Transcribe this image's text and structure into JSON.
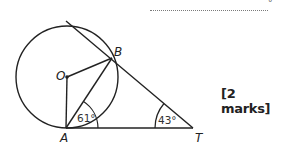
{
  "answer": {
    "line_style": "dotted",
    "unit_symbol": "°"
  },
  "marks_label": "[2 marks]",
  "diagram": {
    "points": {
      "O": {
        "label": "O",
        "x": 67,
        "y": 77
      },
      "A": {
        "label": "A",
        "x": 66,
        "y": 128
      },
      "B": {
        "label": "B",
        "x": 112,
        "y": 58
      },
      "T": {
        "label": "T",
        "x": 193,
        "y": 128
      }
    },
    "circle": {
      "center": "O",
      "radius": 51
    },
    "angles": {
      "BAT": "61°",
      "BTA": "43°"
    },
    "segments": [
      "OA",
      "OB",
      "AB",
      "AT",
      "BT (tangent, extended)"
    ]
  }
}
